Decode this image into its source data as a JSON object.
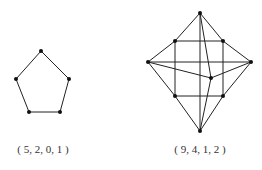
{
  "graphs": [
    {
      "id": "pentagon",
      "label": "( 5, 2, 0, 1 )",
      "label_pos": [
        43,
        150
      ],
      "nodes": [
        [
          41,
          51
        ],
        [
          16,
          79
        ],
        [
          69,
          79
        ],
        [
          29,
          112
        ],
        [
          60,
          112
        ]
      ],
      "edges": [
        [
          0,
          1
        ],
        [
          0,
          2
        ],
        [
          1,
          3
        ],
        [
          2,
          4
        ],
        [
          3,
          4
        ]
      ]
    },
    {
      "id": "nine-vertex-graph",
      "label": "( 9, 4, 1, 2 )",
      "label_pos": [
        200,
        150
      ],
      "nodes": [
        [
          200,
          13
        ],
        [
          175,
          41
        ],
        [
          223,
          41
        ],
        [
          148,
          62
        ],
        [
          251,
          62
        ],
        [
          211,
          78
        ],
        [
          175,
          96
        ],
        [
          223,
          96
        ],
        [
          200,
          131
        ]
      ],
      "edges": [
        [
          0,
          1
        ],
        [
          0,
          2
        ],
        [
          0,
          8
        ],
        [
          0,
          5
        ],
        [
          1,
          2
        ],
        [
          1,
          3
        ],
        [
          2,
          4
        ],
        [
          1,
          6
        ],
        [
          2,
          7
        ],
        [
          3,
          4
        ],
        [
          3,
          5
        ],
        [
          5,
          4
        ],
        [
          5,
          8
        ],
        [
          6,
          7
        ],
        [
          3,
          6
        ],
        [
          6,
          8
        ],
        [
          4,
          7
        ],
        [
          7,
          8
        ]
      ]
    }
  ],
  "colors": {
    "line": "#222222",
    "node": "#111111"
  }
}
